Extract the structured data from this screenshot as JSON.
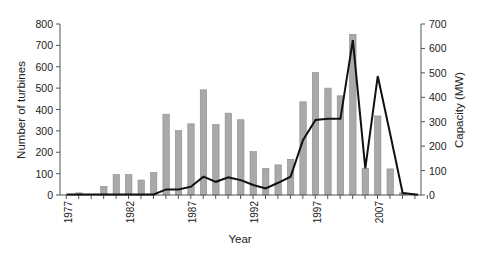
{
  "chart_data": {
    "type": "bar",
    "title": "",
    "xlabel": "Year",
    "ylabel": "Number of turbines",
    "y2label": "Capacity (MW)",
    "ylim": [
      0,
      800
    ],
    "y2lim": [
      0,
      700
    ],
    "yticks": [
      0,
      100,
      200,
      300,
      400,
      500,
      600,
      700,
      800
    ],
    "y2ticks": [
      0,
      100,
      200,
      300,
      400,
      500,
      600,
      700
    ],
    "xtick_labels": [
      {
        "index": 0,
        "label": "1977"
      },
      {
        "index": 5,
        "label": "1982"
      },
      {
        "index": 10,
        "label": "1987"
      },
      {
        "index": 15,
        "label": "1992"
      },
      {
        "index": 20,
        "label": "1997"
      },
      {
        "index": 25,
        "label": "2007"
      }
    ],
    "grid": false,
    "legend": null,
    "categories": [
      "1977",
      "1978",
      "1979",
      "1980",
      "1981",
      "1982",
      "1983",
      "1984",
      "1985",
      "1986",
      "1987",
      "1988",
      "1989",
      "1990",
      "1991",
      "1992",
      "1993",
      "1994",
      "1995",
      "1996",
      "1997",
      "1998",
      "1999",
      "2000",
      "2001",
      "2002",
      "2003",
      "2004",
      "2005"
    ],
    "series": [
      {
        "name": "Number of turbines",
        "type": "bar",
        "axis": "left",
        "color": "#a9a9a9",
        "values": [
          0,
          10,
          0,
          40,
          95,
          95,
          70,
          105,
          378,
          301,
          333,
          492,
          330,
          383,
          352,
          203,
          125,
          141,
          167,
          436,
          573,
          500,
          464,
          752,
          125,
          370,
          122,
          10,
          0
        ]
      },
      {
        "name": "Capacity (MW)",
        "type": "line",
        "axis": "right",
        "color": "#111111",
        "values": [
          2,
          2,
          2,
          2,
          2,
          2,
          2,
          2,
          23,
          23,
          34,
          75,
          54,
          72,
          61,
          41,
          27,
          50,
          75,
          225,
          307,
          312,
          312,
          634,
          109,
          487,
          250,
          8,
          1
        ]
      }
    ]
  }
}
